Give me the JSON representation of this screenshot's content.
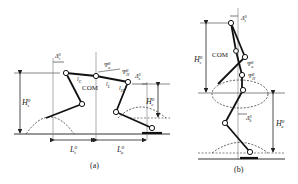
{
  "figure": {
    "panel_a": {
      "caption": "(a)",
      "labels": {
        "delta_s": "Δ",
        "delta_s_sup": "0",
        "delta_s_sub": "s",
        "H_s": "H",
        "H_s_sup": "0",
        "H_s_sub": "s",
        "l_c_left": "l",
        "l_c_left_sub": "C",
        "com": "COM",
        "psi_u": "Ψ",
        "psi_u_sup": "0",
        "psi_u_sub": "u",
        "l_c_right": "l",
        "l_c_right_sub": "L",
        "psi_h": "Ψ",
        "psi_h_sup": "0",
        "psi_h_sub": "H",
        "l_h": "l",
        "l_h_sub": "H",
        "delta_e": "Δ",
        "delta_e_sup": "0",
        "delta_e_sub": "e",
        "H_c": "H",
        "H_c_sup": "0",
        "H_c_sub": "c",
        "L_s": "L",
        "L_s_sup": "0",
        "L_s_sub": "s",
        "L_e": "L",
        "L_e_sup": "0",
        "L_e_sub": "e"
      }
    },
    "panel_b": {
      "caption": "(b)",
      "labels": {
        "delta": "Δ",
        "delta_sup": "0",
        "delta_sub": "s",
        "H_s": "H",
        "H_s_sup": "0",
        "H_s_sub": "s",
        "com": "COM",
        "psi_u": "Ψ",
        "psi_u_sup": "0",
        "psi_u_sub": "u",
        "psi_h": "Ψ",
        "psi_h_sup": "0",
        "psi_h_sub": "H",
        "delta_k": "Δ",
        "delta_k_sup": "0",
        "delta_k_sub": "k",
        "H_e": "H",
        "H_e_sup": "0",
        "H_e_sub": "e"
      }
    },
    "colors": {
      "line": "#222222",
      "dashed": "#333333",
      "guide": "#888888"
    }
  }
}
